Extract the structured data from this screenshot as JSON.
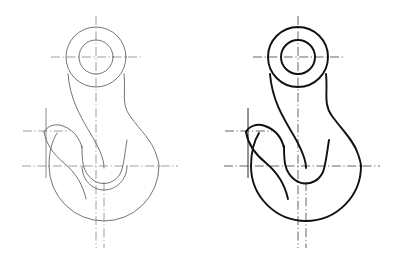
{
  "document": {
    "title": "Lifting Hook — Orthographic Outline",
    "background_color": "#ffffff",
    "width": 398,
    "height": 260,
    "view_count": 2
  },
  "palette": {
    "thin_line": "#5a5a60",
    "thick_line": "#111114",
    "centerline_thin": "#77777e",
    "centerline_thick": "#4a4a50",
    "paper": "#ffffff"
  },
  "views": [
    {
      "id": "left-view",
      "name": "construction-outline",
      "line_weight": "thin",
      "outline_color": "#5a5a60",
      "outline_width": 0.85,
      "centerline_color": "#77777e",
      "centerline_width": 0.7,
      "origin_x": 96,
      "origin_y": 57,
      "geometry": {
        "eye_center": [
          96,
          57
        ],
        "eye_outer_radius": 30,
        "eye_bore_radius": 17,
        "bowl_center": [
          104,
          166
        ],
        "bowl_outer_radius": 55,
        "bowl_inner_radius": 22,
        "throat_y": 166,
        "barb_tip": [
          46,
          131
        ],
        "bottom_y": 221
      },
      "paths": {
        "eye_outer_circle": "M 96 27 m -30 0 a 30 30 0 1 0 60 0 a 30 30 0 1 0 -60 0",
        "eye_bore_circle": "M 96 40 m -17 0 a 17 17 0 1 0 34 0 a 17 17 0 1 0 -34 0",
        "body_outer": "M 66 57 C 66 96 74 110 86 131 C 96 149 100 158 100 168 C 100 182 112 189 124 185 C 145 178 159 160 159 166 C 159 196 134 221 104 221 C 74 221 49 196 49 166 C 49 142 63 128 74 124 C 62 106 66 80 66 57 Z",
        "outer_right_profile": "M 126 57 C 126 74 124 82 131 92 C 139 103 147 104 152 118 C 157 132 159 150 159 166",
        "shank_left_edge": "M 66 57 C 66 92 76 112 88 133 C 97 149 100 157 100 168",
        "shank_right_edge": "M 126 57 C 126 80 120 95 115 110 C 110 127 108 150 108 168",
        "barb_upper": "M 46 131 C 52 127 62 126 73 130 C 94 138 100 152 100 168",
        "barb_lower": "M 46 131 C 50 141 58 149 66 154 C 79 162 88 172 93 182",
        "throat_arc": "M 100 168 A 15 15 0 0 0 130 168"
      },
      "centerlines": {
        "vertical_main": {
          "x": 96,
          "y1": 16,
          "y2": 248
        },
        "vertical_secondary": {
          "x": 104,
          "y1": 182,
          "y2": 248
        },
        "horizontal_eye": {
          "y": 57,
          "x1": 51,
          "x2": 141
        },
        "horizontal_throat": {
          "y": 166,
          "x1": 22,
          "x2": 178
        },
        "vertical_barb": {
          "x": 46,
          "y1": 108,
          "y2": 178
        },
        "horizontal_barb": {
          "y": 131,
          "x1": 23,
          "x2": 70
        }
      }
    },
    {
      "id": "right-view",
      "name": "finished-outline",
      "line_weight": "thick",
      "outline_color": "#111114",
      "outline_width": 1.9,
      "centerline_color": "#4a4a50",
      "centerline_width": 0.85,
      "origin_x": 298,
      "origin_y": 57,
      "geometry": {
        "eye_center": [
          298,
          57
        ],
        "eye_outer_radius": 30,
        "eye_bore_radius": 17,
        "bowl_center": [
          306,
          166
        ],
        "bowl_outer_radius": 55,
        "bowl_inner_radius": 22,
        "throat_y": 166,
        "barb_tip": [
          248,
          131
        ],
        "bottom_y": 221
      },
      "paths": {
        "eye_outer_circle": "M 298 27 m -30 0 a 30 30 0 1 0 60 0 a 30 30 0 1 0 -60 0",
        "eye_bore_circle": "M 298 40 m -17 0 a 17 17 0 1 0 34 0 a 17 17 0 1 0 -34 0",
        "body_outer": "M 268 57 C 268 96 276 110 288 131 C 298 149 302 158 302 168 C 302 182 314 189 326 185 C 347 178 361 160 361 166 C 361 196 336 221 306 221 C 276 221 251 196 251 166 C 251 142 265 128 276 124 C 264 106 268 80 268 57 Z",
        "outer_right_profile": "M 328 57 C 328 74 326 82 333 92 C 341 103 349 104 354 118 C 359 132 361 150 361 166",
        "shank_left_edge": "M 268 57 C 268 92 278 112 290 133 C 299 149 302 157 302 168",
        "shank_right_edge": "M 328 57 C 328 80 322 95 317 110 C 312 127 310 150 310 168",
        "barb_upper": "M 248 131 C 254 127 264 126 275 130 C 296 138 302 152 302 168",
        "barb_lower": "M 248 131 C 252 141 260 149 268 154 C 281 162 290 172 295 182",
        "throat_arc": "M 302 168 A 15 15 0 0 0 332 168"
      },
      "centerlines": {
        "vertical_main": {
          "x": 298,
          "y1": 16,
          "y2": 248
        },
        "vertical_secondary": {
          "x": 306,
          "y1": 182,
          "y2": 248
        },
        "horizontal_eye": {
          "y": 57,
          "x1": 253,
          "x2": 343
        },
        "horizontal_throat": {
          "y": 166,
          "x1": 224,
          "x2": 380
        },
        "vertical_barb": {
          "x": 248,
          "y1": 108,
          "y2": 178
        },
        "horizontal_barb": {
          "y": 131,
          "x1": 225,
          "x2": 272
        }
      }
    }
  ]
}
